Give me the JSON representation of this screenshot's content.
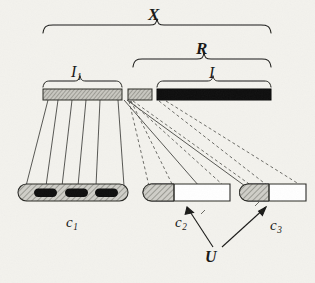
{
  "figure": {
    "background_color": "#f3f2ed",
    "ink_color": "#1a1a18",
    "hatch_color": "#9a9a92",
    "solid_black": "#111111",
    "labels": {
      "X": "X",
      "R": "R",
      "I1_base": "I",
      "I1_sub": "1",
      "I": "I",
      "c1_base": "c",
      "c1_sub": "1",
      "c2_base": "c",
      "c2_sub": "2",
      "c3_base": "c",
      "c3_sub": "3",
      "U": "U"
    },
    "braces": [
      {
        "name": "brace-X",
        "label": "X",
        "x1": 43,
        "x2": 271,
        "y": 28
      },
      {
        "name": "brace-R",
        "label": "R",
        "x1": 133,
        "x2": 271,
        "y": 62
      },
      {
        "name": "brace-I1",
        "label": "I1",
        "x1": 43,
        "x2": 122,
        "y": 85
      },
      {
        "name": "brace-I",
        "label": "I",
        "x1": 157,
        "x2": 271,
        "y": 85
      }
    ],
    "top_bars": [
      {
        "name": "top-bar-I1",
        "x": 43,
        "width": 79,
        "fill": "hatched"
      },
      {
        "name": "top-bar-small",
        "x": 128,
        "width": 24,
        "fill": "hatched"
      },
      {
        "name": "top-bar-I",
        "x": 157,
        "width": 114,
        "fill": "black"
      }
    ],
    "top_bar_y": 89,
    "top_bar_height": 11,
    "bottom_capsules": [
      {
        "name": "capsule-c1",
        "label": "c1",
        "x": 18,
        "width": 110,
        "hatch_width": 110,
        "holes": [
          {
            "x": 34,
            "width": 22
          },
          {
            "x": 64,
            "width": 22
          },
          {
            "x": 94,
            "width": 22
          }
        ]
      },
      {
        "name": "capsule-c2",
        "label": "c2",
        "x": 143,
        "width": 87,
        "hatch_width": 30,
        "holes": []
      },
      {
        "name": "capsule-c3",
        "label": "c3",
        "x": 240,
        "width": 66,
        "hatch_width": 22,
        "holes": []
      }
    ],
    "bottom_capsule_y": 184,
    "bottom_capsule_height": 17,
    "solid_connectors": [
      {
        "from_x": 48,
        "to_x": 26
      },
      {
        "from_x": 58,
        "to_x": 46
      },
      {
        "from_x": 72,
        "to_x": 62
      },
      {
        "from_x": 86,
        "to_x": 78
      },
      {
        "from_x": 100,
        "to_x": 96
      },
      {
        "from_x": 118,
        "to_x": 124
      },
      {
        "from_x": 130,
        "to_x": 200
      },
      {
        "from_x": 131,
        "to_x": 246
      }
    ],
    "dashed_connectors": [
      {
        "from_x": 130,
        "to_x": 150
      },
      {
        "from_x": 132,
        "to_x": 174
      },
      {
        "from_x": 160,
        "to_x": 224
      },
      {
        "from_x": 168,
        "to_x": 252
      },
      {
        "from_x": 176,
        "to_x": 300
      },
      {
        "from_x": 159,
        "to_x": 268
      }
    ],
    "arrows": [
      {
        "name": "arrow-U-to-c2",
        "from_x": 212,
        "from_y": 246,
        "to_x": 186,
        "to_y": 206
      },
      {
        "name": "arrow-U-to-c3",
        "from_x": 222,
        "from_y": 246,
        "to_x": 266,
        "to_y": 206
      }
    ]
  }
}
